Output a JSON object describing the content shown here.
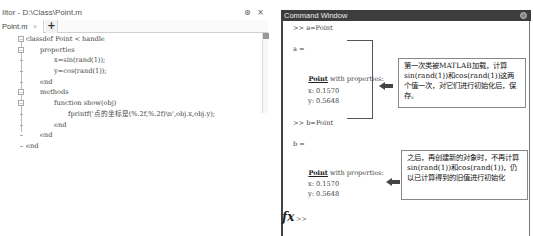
{
  "editor": {
    "title": "Iitor - D:\\Class\\Point.m",
    "title_buttons": [
      "⊛",
      "×"
    ],
    "tab": {
      "label": "Point.m",
      "close": "×"
    },
    "add_tab": "+",
    "code_lines": [
      {
        "text": "classdef Point < handle",
        "indent": 0,
        "fold": "−"
      },
      {
        "text": "properties",
        "indent": 1,
        "fold": "−"
      },
      {
        "text": "x=sin(rand(1));",
        "indent": 2,
        "fold": ""
      },
      {
        "text": "y=cos(rand(1));",
        "indent": 2,
        "fold": ""
      },
      {
        "text": "end",
        "indent": 1,
        "fold": ""
      },
      {
        "text": "methods",
        "indent": 1,
        "fold": "−"
      },
      {
        "text": "function show(obj)",
        "indent": 2,
        "fold": "−"
      },
      {
        "text": "fprintf('点的坐标是(%.2f,%.2f)\\n',obj.x,obj.y);",
        "indent": 3,
        "fold": ""
      },
      {
        "text": "end",
        "indent": 2,
        "fold": ""
      },
      {
        "text": "end",
        "indent": 1,
        "fold": ""
      },
      {
        "text": "end",
        "indent": 0,
        "fold": ""
      }
    ]
  },
  "command_window": {
    "title": "Command Window",
    "lines": {
      "cmd_a": ">> a=Point",
      "a_eq": "a =",
      "a_class": "Point",
      "a_with": " with properties:",
      "a_x": "x: 0.1570",
      "a_y": "y: 0.5648",
      "cmd_b": ">> b=Point",
      "b_eq": "b =",
      "b_class": "Point",
      "b_with": " with properties:",
      "b_x": "x: 0.1570",
      "b_y": "y: 0.5648"
    },
    "fx_label": "fx",
    "prompt": ">>"
  },
  "annotations": [
    {
      "text": "第一次类被MATLAB加载，计算sin(rand(1))和cos(rand(1))这两个值一次，对它们进行初始化后，保存。"
    },
    {
      "text": "之后，再创建新的对象时，不再计算sin(rand(1))和cos(rand(1))，仍以已计算得到的旧值进行初始化"
    }
  ],
  "colors": {
    "titlebar": "#3d3d3d",
    "arrow": "#444444",
    "code_text": "#444444"
  }
}
